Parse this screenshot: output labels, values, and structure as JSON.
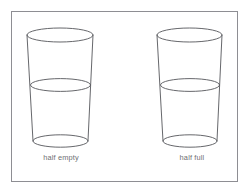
{
  "figure": {
    "background_color": "#ffffff",
    "frame": {
      "name": "border-frame",
      "stroke_color": "#8e8e93",
      "stroke_width": 1,
      "x": 11,
      "y": 11,
      "width": 227,
      "height": 171
    },
    "line_color": "#55565a",
    "line_width": 0.9,
    "text_color": "#6e6f73",
    "glasses": [
      {
        "id": "glass-left",
        "caption": "half empty",
        "fill_fraction": 0.5,
        "geometry": {
          "rim_center_x": 60,
          "rim_center_y": 35,
          "rim_rx": 33,
          "rim_ry": 7,
          "waterline_center_x": 60.5,
          "waterline_center_y": 85,
          "waterline_rx": 30,
          "waterline_ry": 6.4,
          "base_center_x": 60.5,
          "base_center_y": 141,
          "base_rx": 27.5,
          "base_ry": 6.2
        }
      },
      {
        "id": "glass-right",
        "caption": "half full",
        "fill_fraction": 0.5,
        "geometry": {
          "rim_center_x": 189.5,
          "rim_center_y": 35,
          "rim_rx": 32.5,
          "rim_ry": 7,
          "waterline_center_x": 190,
          "waterline_center_y": 85,
          "waterline_rx": 29.5,
          "waterline_ry": 6.4,
          "base_center_x": 190,
          "base_center_y": 141,
          "base_rx": 27,
          "base_ry": 6.2
        }
      }
    ]
  },
  "captions": {
    "left": "half empty",
    "right": "half full"
  }
}
